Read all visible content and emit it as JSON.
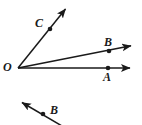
{
  "figure": {
    "background_color": "#ffffff",
    "stroke_color": "#1a1a1a",
    "labels": {
      "vertex_O": "O",
      "point_C": "C",
      "point_B_upper": "B",
      "point_A": "A",
      "point_B_lower": "B"
    },
    "vertex": {
      "name": "O",
      "x": 18,
      "y": 68
    },
    "rays": [
      {
        "name": "ray-OC",
        "from": {
          "x": 18,
          "y": 68
        },
        "to": {
          "x": 68,
          "y": 6
        },
        "arrow": "end",
        "marked_point": {
          "label": "C",
          "x": 50,
          "y": 29
        }
      },
      {
        "name": "ray-OB",
        "from": {
          "x": 18,
          "y": 68
        },
        "to": {
          "x": 140,
          "y": 44
        },
        "arrow": "end",
        "marked_point": {
          "label": "B",
          "x": 109,
          "y": 51
        }
      },
      {
        "name": "ray-OA",
        "from": {
          "x": 18,
          "y": 68
        },
        "to": {
          "x": 140,
          "y": 68
        },
        "arrow": "end",
        "marked_point": {
          "label": "A",
          "x": 108,
          "y": 68
        }
      },
      {
        "name": "ray-lower-B",
        "from": {
          "x": 61,
          "y": 125
        },
        "to": {
          "x": 17,
          "y": 99
        },
        "arrow": "end",
        "marked_point": {
          "label": "B",
          "x": 43,
          "y": 114
        }
      }
    ]
  }
}
